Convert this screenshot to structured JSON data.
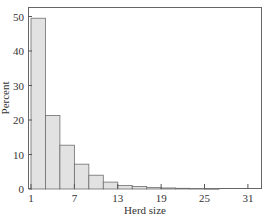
{
  "chart_data": {
    "type": "bar",
    "title": "",
    "xlabel": "Herd size",
    "ylabel": "Percent",
    "x_ticks": [
      1,
      7,
      13,
      19,
      25,
      31
    ],
    "y_ticks": [
      0,
      10,
      20,
      30,
      40,
      50
    ],
    "xlim": [
      0.5,
      33
    ],
    "ylim": [
      0,
      52
    ],
    "grid": false,
    "bin_width": 2,
    "bins": [
      {
        "start": 1,
        "end": 3,
        "value": 49.5
      },
      {
        "start": 3,
        "end": 5,
        "value": 21.3
      },
      {
        "start": 5,
        "end": 7,
        "value": 12.7
      },
      {
        "start": 7,
        "end": 9,
        "value": 7.2
      },
      {
        "start": 9,
        "end": 11,
        "value": 4.0
      },
      {
        "start": 11,
        "end": 13,
        "value": 2.0
      },
      {
        "start": 13,
        "end": 15,
        "value": 1.0
      },
      {
        "start": 15,
        "end": 17,
        "value": 0.7
      },
      {
        "start": 17,
        "end": 19,
        "value": 0.4
      },
      {
        "start": 19,
        "end": 21,
        "value": 0.3
      },
      {
        "start": 21,
        "end": 23,
        "value": 0.2
      },
      {
        "start": 23,
        "end": 25,
        "value": 0.1
      },
      {
        "start": 25,
        "end": 27,
        "value": 0.05
      }
    ],
    "colors": {
      "bar_fill": "#e2e2e2",
      "bar_edge": "#6e6e6e",
      "axis": "#555555"
    }
  }
}
